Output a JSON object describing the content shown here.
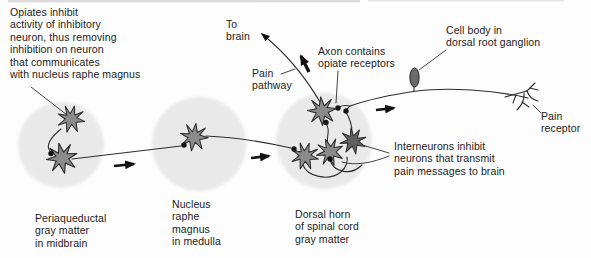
{
  "labels": {
    "opiates_note": "Opiates inhibit\nactivity of inhibitory\nneuron, thus removing\ninhibition on neuron\nthat communicates\nwith nucleus raphe magnus",
    "to_brain": "To\nbrain",
    "pain_pathway": "Pain\npathway",
    "axon_opiate_receptors": "Axon contains\nopiate receptors",
    "cell_body": "Cell body in\ndorsal root ganglion",
    "pain_receptor": "Pain\nreceptor",
    "interneurons": "Interneurons inhibit\nneurons that transmit\npain messages to brain",
    "region_periaqueductal": "Periaqueductal\ngray matter\nin midbrain",
    "region_raphe": "Nucleus\nraphe\nmagnus\nin medulla",
    "region_dorsal_horn": "Dorsal horn\nof spinal cord\ngray matter"
  },
  "colors": {
    "background": "#fdfdfd",
    "region_circle": "#e9e9e9",
    "neuron_fill": "#8b8b8b",
    "neuron_dark_fill": "#606060",
    "cell_body_fill": "#6b6b6b",
    "line": "#2e2e2e",
    "arrow": "#111111",
    "text": "#222222"
  },
  "icons": {
    "neuron": "star-burst-neuron-shape",
    "synapse": "filled-dot",
    "flow_arrow": "solid-right-arrow",
    "cell_body": "dark-oval"
  }
}
